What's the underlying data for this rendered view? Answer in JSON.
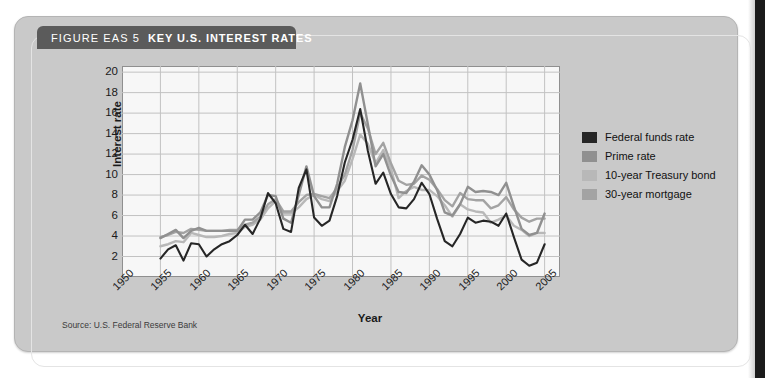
{
  "figure": {
    "label": "FIGURE EAS 5",
    "title": "KEY U.S. INTEREST RATES",
    "source": "Source: U.S. Federal Reserve Bank"
  },
  "chart_data": {
    "type": "line",
    "title": "Key U.S. Interest Rates",
    "xlabel": "Year",
    "ylabel": "Interest rate",
    "xlim": [
      1950,
      2007
    ],
    "ylim": [
      0,
      20.6
    ],
    "yticks": [
      2,
      4,
      6,
      8,
      10,
      12,
      14,
      16,
      18,
      20
    ],
    "xticks": [
      1950,
      1955,
      1960,
      1965,
      1970,
      1975,
      1980,
      1985,
      1990,
      1995,
      2000,
      2005
    ],
    "grid": true,
    "legend_position": "right",
    "x": [
      1955,
      1956,
      1957,
      1958,
      1959,
      1960,
      1961,
      1962,
      1963,
      1964,
      1965,
      1966,
      1967,
      1968,
      1969,
      1970,
      1971,
      1972,
      1973,
      1974,
      1975,
      1976,
      1977,
      1978,
      1979,
      1980,
      1981,
      1982,
      1983,
      1984,
      1985,
      1986,
      1987,
      1988,
      1989,
      1990,
      1991,
      1992,
      1993,
      1994,
      1995,
      1996,
      1997,
      1998,
      1999,
      2000,
      2001,
      2002,
      2003,
      2004,
      2005
    ],
    "series": [
      {
        "name": "Federal funds rate",
        "color": "#262626",
        "values": [
          1.8,
          2.7,
          3.1,
          1.6,
          3.3,
          3.2,
          2.0,
          2.7,
          3.2,
          3.5,
          4.1,
          5.1,
          4.2,
          5.7,
          8.2,
          7.2,
          4.7,
          4.4,
          8.7,
          10.5,
          5.8,
          5.0,
          5.5,
          7.9,
          11.2,
          13.4,
          16.4,
          12.3,
          9.1,
          10.2,
          8.1,
          6.8,
          6.7,
          7.6,
          9.2,
          8.1,
          5.7,
          3.5,
          3.0,
          4.2,
          5.8,
          5.3,
          5.5,
          5.4,
          5.0,
          6.2,
          3.9,
          1.7,
          1.1,
          1.4,
          3.2
        ]
      },
      {
        "name": "Prime rate",
        "color": "#909090",
        "values": [
          3.8,
          4.2,
          4.6,
          3.8,
          4.5,
          4.8,
          4.5,
          4.5,
          4.5,
          4.5,
          4.5,
          5.6,
          5.6,
          6.3,
          8.0,
          7.9,
          5.7,
          5.3,
          8.0,
          10.8,
          7.9,
          6.8,
          6.8,
          9.1,
          12.7,
          15.3,
          18.9,
          14.9,
          10.8,
          12.0,
          9.9,
          8.3,
          8.2,
          9.3,
          10.9,
          10.0,
          8.5,
          6.3,
          6.0,
          7.1,
          8.8,
          8.3,
          8.4,
          8.3,
          8.0,
          9.2,
          6.9,
          4.7,
          4.1,
          4.3,
          6.2
        ]
      },
      {
        "name": "10-year Treasury bond",
        "color": "#b8b8b8",
        "values": [
          3.0,
          3.2,
          3.5,
          3.4,
          4.3,
          4.1,
          3.9,
          3.9,
          4.0,
          4.2,
          4.3,
          4.9,
          5.1,
          5.6,
          6.7,
          7.4,
          6.2,
          6.2,
          6.8,
          7.6,
          8.0,
          7.6,
          7.4,
          8.4,
          9.4,
          11.5,
          13.9,
          13.0,
          11.1,
          12.4,
          10.6,
          7.7,
          8.4,
          8.8,
          8.5,
          8.5,
          7.9,
          7.0,
          5.9,
          7.1,
          6.6,
          6.4,
          6.3,
          5.3,
          5.6,
          6.0,
          5.0,
          4.6,
          4.0,
          4.3,
          4.3
        ]
      },
      {
        "name": "30-year mortgage",
        "color": "#a3a3a3",
        "values": [
          3.9,
          4.1,
          4.4,
          4.3,
          4.7,
          4.6,
          4.5,
          4.5,
          4.5,
          4.6,
          4.6,
          5.1,
          5.3,
          5.9,
          7.1,
          7.6,
          6.4,
          6.4,
          7.3,
          8.0,
          8.1,
          7.9,
          7.7,
          8.7,
          10.0,
          12.4,
          16.0,
          14.5,
          12.0,
          13.1,
          11.1,
          9.4,
          9.0,
          9.1,
          9.9,
          9.5,
          8.6,
          7.5,
          6.9,
          8.2,
          7.6,
          7.5,
          7.5,
          6.7,
          7.0,
          7.8,
          6.6,
          5.8,
          5.4,
          5.7,
          5.7
        ]
      }
    ]
  },
  "legend": {
    "items": [
      {
        "label": "Federal funds rate",
        "color": "#262626"
      },
      {
        "label": "Prime rate",
        "color": "#909090"
      },
      {
        "label": "10-year Treasury bond",
        "color": "#b8b8b8"
      },
      {
        "label": "30-year mortgage",
        "color": "#a3a3a3"
      }
    ]
  }
}
